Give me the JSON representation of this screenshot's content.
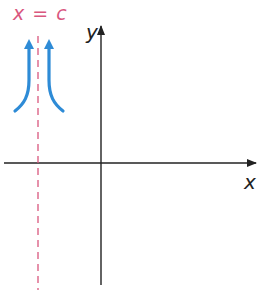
{
  "diagram": {
    "asymptote_label": "x = c",
    "y_axis_label": "y",
    "x_axis_label": "x",
    "colors": {
      "axis": "#222222",
      "asymptote": "#d9577e",
      "curve": "#2e8bd6",
      "background": "#ffffff"
    },
    "elements": [
      {
        "type": "axis",
        "name": "x-axis",
        "direction": "horizontal",
        "arrow": "right"
      },
      {
        "type": "axis",
        "name": "y-axis",
        "direction": "vertical",
        "arrow": "up"
      },
      {
        "type": "dashed-line",
        "name": "vertical-asymptote",
        "label": "x = c"
      },
      {
        "type": "curve",
        "name": "left-branch",
        "behavior": "rises to +infinity as x approaches c from left"
      },
      {
        "type": "curve",
        "name": "right-branch",
        "behavior": "rises to +infinity as x approaches c from right"
      }
    ]
  }
}
